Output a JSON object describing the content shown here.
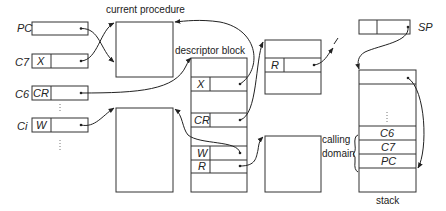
{
  "diagram": {
    "labels": {
      "current_procedure": "current procedure",
      "descriptor_block": "descriptor block",
      "calling_domain_1": "calling",
      "calling_domain_2": "domain",
      "stack": "stack",
      "sp": "SP"
    },
    "registers": [
      {
        "name": "PC",
        "field": ""
      },
      {
        "name": "C7",
        "field": "X"
      },
      {
        "name": "C6",
        "field": "CR"
      },
      {
        "name": "Ci",
        "field": "W"
      }
    ],
    "descriptor_entries": [
      "X",
      "CR",
      "W",
      "R"
    ],
    "upper_right_block_entry": "R",
    "stack_entries": [
      "⋮",
      "C6",
      "C7",
      "PC"
    ],
    "ellipsis": "⋮"
  }
}
